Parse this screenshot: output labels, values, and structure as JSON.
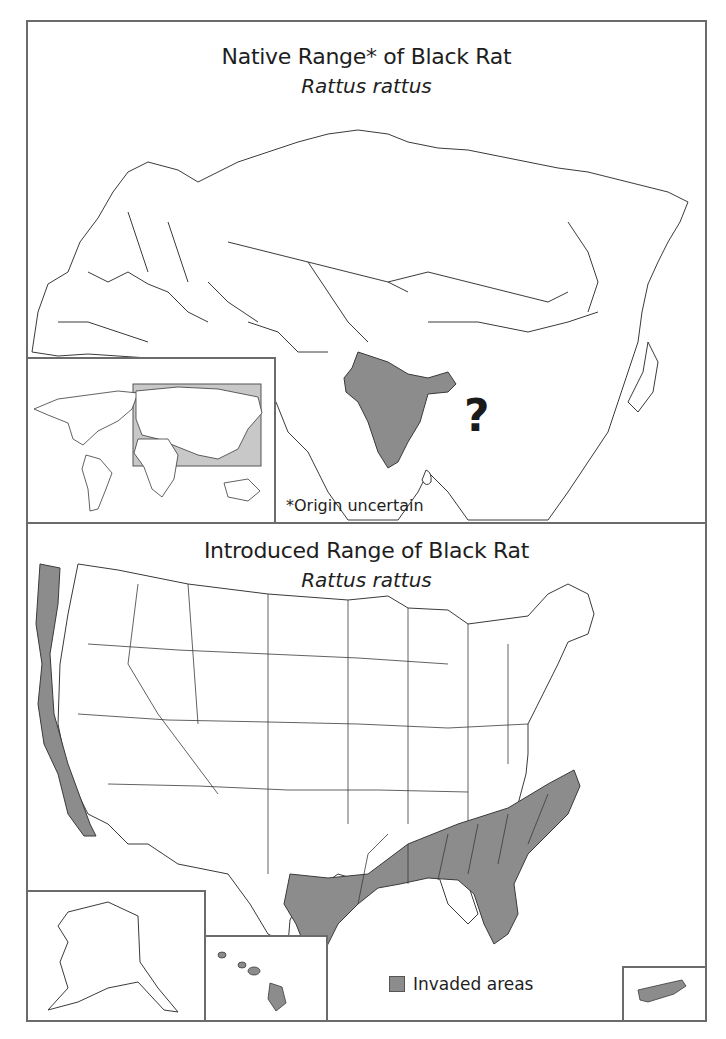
{
  "native_panel": {
    "title": "Native Range* of Black Rat",
    "subtitle": "Rattus rattus",
    "highlighted_region": "India / South Asia",
    "uncertain_marker": "?",
    "footnote": "*Origin uncertain",
    "inset": {
      "label": "world-locator-map",
      "highlight_box": "Eurasia extent"
    }
  },
  "introduced_panel": {
    "title": "Introduced Range of Black Rat",
    "subtitle": "Rattus rattus",
    "highlighted_regions": [
      "Pacific coast (WA, OR, CA)",
      "Gulf coast and Southeast US",
      "Hawaii",
      "Puerto Rico"
    ],
    "insets": [
      "Alaska",
      "Hawaii",
      "Puerto Rico"
    ],
    "legend": {
      "label": "Invaded areas",
      "color": "#8c8c8c"
    }
  },
  "colors": {
    "frame": "#6b6b6b",
    "fill": "#8c8c8c",
    "line": "#3a3a3a",
    "locator": "#c8c8c8"
  }
}
